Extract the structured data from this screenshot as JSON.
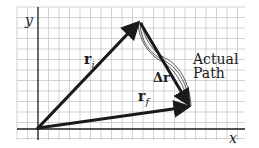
{
  "figure": {
    "axes": {
      "x_label": "x",
      "y_label": "y"
    },
    "vectors": {
      "initial": {
        "label": "r",
        "subscript": "i"
      },
      "final": {
        "label": "r",
        "subscript": "f"
      },
      "displacement": {
        "label": "Δr"
      }
    },
    "annotation": {
      "line1": "Actual",
      "line2": "Path"
    },
    "colors": {
      "grid": "#c8c8c8",
      "axis": "#1a1a1a",
      "vector": "#1a1a1a",
      "text": "#1a1a1a"
    }
  }
}
